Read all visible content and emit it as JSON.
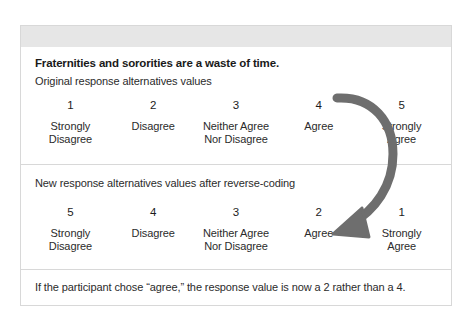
{
  "figure": {
    "title": "Fraternities and sororities are a waste of time.",
    "original": {
      "heading": "Original response alternatives values",
      "columns": [
        {
          "value": "1",
          "label": "Strongly\nDisagree"
        },
        {
          "value": "2",
          "label": "Disagree"
        },
        {
          "value": "3",
          "label": "Neither Agree\nNor Disagree"
        },
        {
          "value": "4",
          "label": "Agree"
        },
        {
          "value": "5",
          "label": "Strongly\nAgree"
        }
      ]
    },
    "recoded": {
      "heading": "New response alternatives values after reverse-coding",
      "columns": [
        {
          "value": "5",
          "label": "Strongly\nDisagree"
        },
        {
          "value": "4",
          "label": "Disagree"
        },
        {
          "value": "3",
          "label": "Neither Agree\nNor Disagree"
        },
        {
          "value": "2",
          "label": "Agree"
        },
        {
          "value": "1",
          "label": "Strongly\nAgree"
        }
      ]
    },
    "note": "If the participant chose “agree,” the response value is now a 2 rather than a 4.",
    "arrow": {
      "name": "reverse-coding-arrow",
      "from_value": "4",
      "to_value": "2",
      "color": "#6e6e6e"
    },
    "colors": {
      "background": "#ffffff",
      "card_border": "#d8d8d8",
      "header_band": "#e6e6e6",
      "text": "#2b2b2b",
      "title_text": "#1a1a1a",
      "arrow": "#6e6e6e"
    }
  }
}
